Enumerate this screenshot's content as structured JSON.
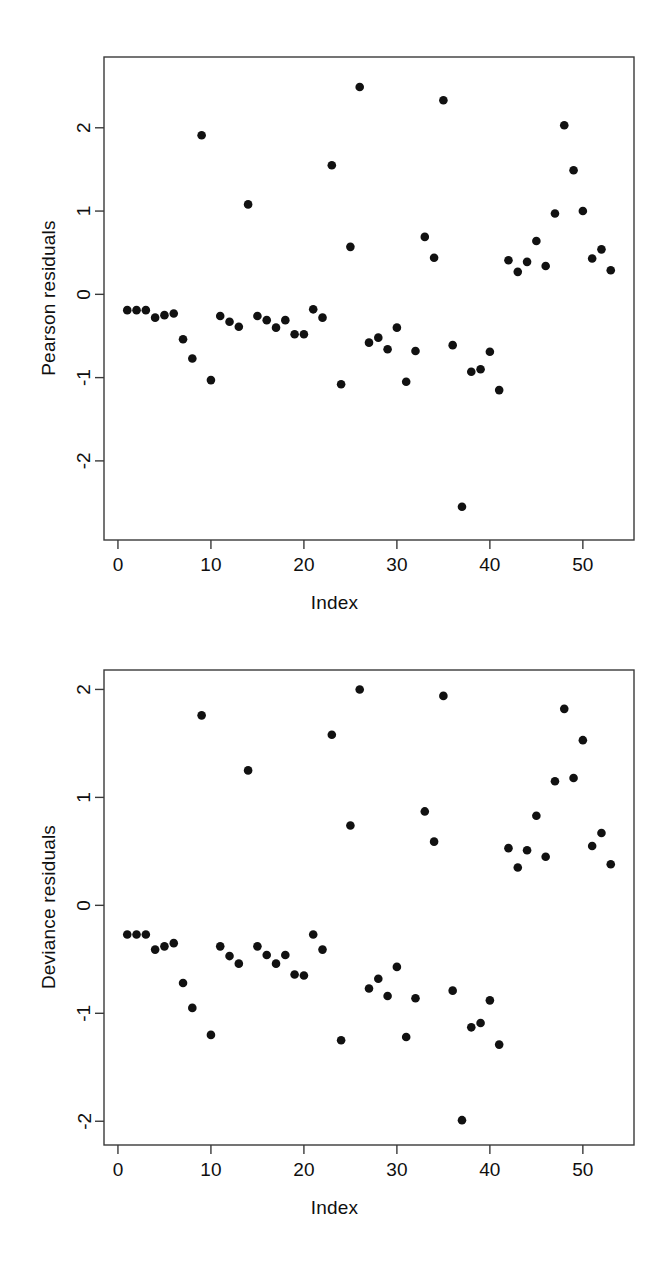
{
  "page": {
    "background_color": "#ffffff",
    "point_color": "#111111",
    "axis_color": "#3a3a3a"
  },
  "figures": [
    {
      "id": "pearson",
      "y_axis_title": "Pearson residuals",
      "x_axis_title": "Index"
    },
    {
      "id": "deviance",
      "y_axis_title": "Deviance residuals",
      "x_axis_title": "Index"
    }
  ],
  "chart_data": [
    {
      "type": "scatter",
      "title": "",
      "subtitle": "",
      "xlabel": "Index",
      "ylabel": "Pearson residuals",
      "xlim": [
        -1.5,
        55.5
      ],
      "ylim": [
        -2.95,
        2.85
      ],
      "xticks": [
        0,
        10,
        20,
        30,
        40,
        50
      ],
      "yticks": [
        -2,
        -1,
        0,
        1,
        2
      ],
      "xticklabels": [
        "0",
        "10",
        "20",
        "30",
        "40",
        "50"
      ],
      "yticklabels": [
        "-2",
        "-1",
        "0",
        "1",
        "2"
      ],
      "grid": false,
      "legend": false,
      "marker": "filled-circle",
      "marker_color": "#111111",
      "x": [
        1,
        2,
        3,
        4,
        5,
        6,
        7,
        8,
        9,
        10,
        11,
        12,
        13,
        14,
        15,
        16,
        17,
        18,
        19,
        20,
        21,
        22,
        23,
        24,
        25,
        26,
        27,
        28,
        29,
        30,
        31,
        32,
        33,
        34,
        35,
        36,
        37,
        38,
        39,
        40,
        41,
        42,
        43,
        44,
        45,
        46,
        47,
        48,
        49,
        50,
        51,
        52,
        53
      ],
      "y": [
        -0.19,
        -0.19,
        -0.19,
        -0.28,
        -0.25,
        -0.23,
        -0.54,
        -0.77,
        1.91,
        -1.03,
        -0.26,
        -0.33,
        -0.39,
        1.08,
        -0.26,
        -0.31,
        -0.4,
        -0.31,
        -0.48,
        -0.48,
        -0.18,
        -0.28,
        1.55,
        -1.08,
        0.57,
        2.49,
        -0.58,
        -0.52,
        -0.66,
        -0.4,
        -1.05,
        -0.68,
        0.69,
        0.44,
        2.33,
        -0.61,
        -2.55,
        -0.93,
        -0.9,
        -0.69,
        -1.15,
        0.41,
        0.27,
        0.39,
        0.64,
        0.34,
        0.97,
        2.03,
        1.49,
        1.0,
        0.43,
        0.54,
        0.29
      ]
    },
    {
      "type": "scatter",
      "title": "",
      "subtitle": "",
      "xlabel": "Index",
      "ylabel": "Deviance residuals",
      "xlim": [
        -1.5,
        55.5
      ],
      "ylim": [
        -2.22,
        2.18
      ],
      "xticks": [
        0,
        10,
        20,
        30,
        40,
        50
      ],
      "yticks": [
        -2,
        -1,
        0,
        1,
        2
      ],
      "xticklabels": [
        "0",
        "10",
        "20",
        "30",
        "40",
        "50"
      ],
      "yticklabels": [
        "-2",
        "-1",
        "0",
        "1",
        "2"
      ],
      "grid": false,
      "legend": false,
      "marker": "filled-circle",
      "marker_color": "#111111",
      "x": [
        1,
        2,
        3,
        4,
        5,
        6,
        7,
        8,
        9,
        10,
        11,
        12,
        13,
        14,
        15,
        16,
        17,
        18,
        19,
        20,
        21,
        22,
        23,
        24,
        25,
        26,
        27,
        28,
        29,
        30,
        31,
        32,
        33,
        34,
        35,
        36,
        37,
        38,
        39,
        40,
        41,
        42,
        43,
        44,
        45,
        46,
        47,
        48,
        49,
        50,
        51,
        52,
        53
      ],
      "y": [
        -0.27,
        -0.27,
        -0.27,
        -0.41,
        -0.38,
        -0.35,
        -0.72,
        -0.95,
        1.76,
        -1.2,
        -0.38,
        -0.47,
        -0.54,
        1.25,
        -0.38,
        -0.46,
        -0.54,
        -0.46,
        -0.64,
        -0.65,
        -0.27,
        -0.41,
        1.58,
        -1.25,
        0.74,
        2.0,
        -0.77,
        -0.68,
        -0.84,
        -0.57,
        -1.22,
        -0.86,
        0.87,
        0.59,
        1.94,
        -0.79,
        -1.99,
        -1.13,
        -1.09,
        -0.88,
        -1.29,
        0.53,
        0.35,
        0.51,
        0.83,
        0.45,
        1.15,
        1.82,
        1.18,
        1.53,
        0.55,
        0.67,
        0.38
      ]
    }
  ]
}
